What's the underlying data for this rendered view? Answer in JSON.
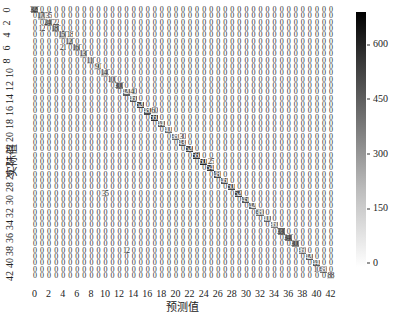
{
  "chart_data": {
    "type": "heatmap",
    "title": "",
    "xlabel": "预测值",
    "ylabel": "实际值",
    "size": 43,
    "x_ticks": [
      "0",
      "2",
      "4",
      "6",
      "8",
      "10",
      "12",
      "14",
      "16",
      "18",
      "20",
      "22",
      "24",
      "26",
      "28",
      "30",
      "32",
      "34",
      "36",
      "38",
      "40",
      "42"
    ],
    "y_ticks": [
      "0",
      "2",
      "4",
      "6",
      "8",
      "10",
      "12",
      "14",
      "16",
      "18",
      "20",
      "22",
      "24",
      "26",
      "28",
      "30",
      "32",
      "34",
      "36",
      "38",
      "40",
      "42"
    ],
    "colorbar": {
      "min": 0,
      "max": 700,
      "ticks": [
        "0",
        "150",
        "300",
        "450",
        "600"
      ],
      "colormap": "Greys"
    },
    "diagonal": [
      329,
      170,
      240,
      180,
      150,
      120,
      160,
      130,
      110,
      90,
      140,
      100,
      300,
      420,
      460,
      520,
      480,
      560,
      440,
      400,
      380,
      430,
      520,
      560,
      600,
      540,
      480,
      460,
      500,
      520,
      450,
      420,
      380,
      400,
      360,
      330,
      340,
      300,
      360,
      420,
      440,
      380,
      88
    ],
    "off_diagonal_default": 0,
    "notable_off_diagonal": [
      {
        "r": 1,
        "c": 2,
        "v": 35
      },
      {
        "r": 2,
        "c": 3,
        "v": 22
      },
      {
        "r": 3,
        "c": 1,
        "v": 12
      },
      {
        "r": 4,
        "c": 5,
        "v": 18
      },
      {
        "r": 6,
        "c": 4,
        "v": 21
      },
      {
        "r": 13,
        "c": 14,
        "v": 40
      },
      {
        "r": 16,
        "c": 17,
        "v": 60
      },
      {
        "r": 20,
        "c": 21,
        "v": 30
      },
      {
        "r": 24,
        "c": 25,
        "v": 25
      },
      {
        "r": 29,
        "c": 10,
        "v": 35
      },
      {
        "r": 38,
        "c": 13,
        "v": 12
      },
      {
        "r": 41,
        "c": 40,
        "v": 10
      }
    ]
  }
}
